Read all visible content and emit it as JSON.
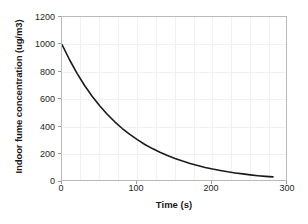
{
  "chart_data": {
    "type": "line",
    "title": "",
    "xlabel": "Time (s)",
    "ylabel": "Indoor fume concentration (ug/m3)",
    "xlim": [
      0,
      300
    ],
    "ylim": [
      0,
      1200
    ],
    "xticks": [
      0,
      100,
      200,
      300
    ],
    "yticks": [
      0,
      200,
      400,
      600,
      800,
      1000,
      1200
    ],
    "xtick_labels": [
      "0",
      "100",
      "200",
      "300"
    ],
    "ytick_labels": [
      "0",
      "200",
      "400",
      "600",
      "800",
      "1000",
      "1200"
    ],
    "grid": true,
    "grid_color": "#f0f0f0",
    "legend": null,
    "series": [
      {
        "name": "Indoor fume concentration",
        "color": "#1a1a1a",
        "linewidth": 1.6,
        "x": [
          0,
          10,
          20,
          30,
          40,
          50,
          60,
          70,
          80,
          90,
          100,
          110,
          120,
          130,
          140,
          150,
          160,
          170,
          180,
          190,
          200,
          210,
          220,
          230,
          240,
          250,
          260,
          270,
          280
        ],
        "y": [
          1000,
          889,
          790,
          702,
          624,
          555,
          493,
          438,
          389,
          346,
          308,
          273,
          243,
          216,
          192,
          171,
          152,
          135,
          120,
          106,
          94,
          84,
          74,
          66,
          59,
          52,
          46,
          41,
          37
        ]
      }
    ]
  },
  "axis": {
    "frame_color": "#b9b9b9",
    "tick_color": "#9a9a9a",
    "text_color": "#262626"
  }
}
